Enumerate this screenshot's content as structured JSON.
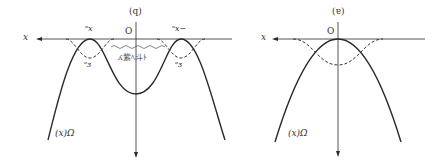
{
  "panels": [
    {
      "id": "left",
      "panel_label": "(q)",
      "origin_label": "O",
      "axis_label": "x",
      "curve_label": "(x)Ω",
      "peak_label_left": "ᵒx",
      "peak_label_right": "ᵒx−",
      "level_label_left": "ᵒɜ",
      "level_label_right": "ᵒɜ",
      "annotation": "ʎ紫ﾍ斗ﾄ"
    },
    {
      "id": "right",
      "panel_label": "(ɐ)",
      "origin_label": "O",
      "axis_label": "x",
      "curve_label": "(x)Ω"
    }
  ],
  "colors": {
    "line": "#2a2a2a",
    "dashed": "#333333",
    "text": "#333333"
  }
}
